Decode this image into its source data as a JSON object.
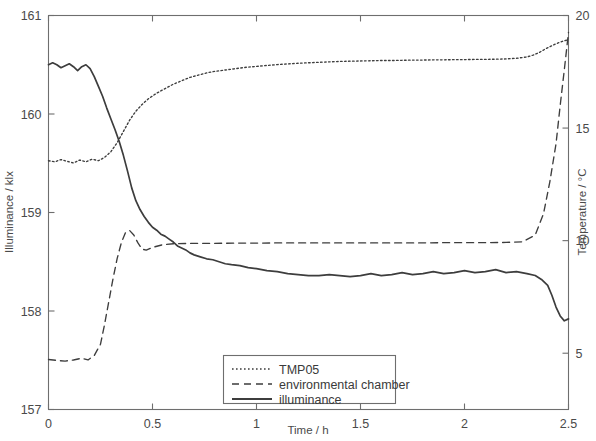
{
  "chart_data": {
    "type": "line",
    "title": "",
    "xlabel": "Time / h",
    "ylabel": "Illuminance / klx",
    "y2label": "Temperature / °C",
    "xlim": [
      0,
      2.5
    ],
    "ylim": [
      157,
      161
    ],
    "y2lim": [
      2.5,
      20
    ],
    "xticks": [
      0,
      0.5,
      1,
      1.5,
      2,
      2.5
    ],
    "xticklabels": [
      "0",
      "0.5",
      "1",
      "1.5",
      "2",
      "2.5"
    ],
    "yticks": [
      157,
      158,
      159,
      160,
      161
    ],
    "yticklabels": [
      "157",
      "158",
      "159",
      "160",
      "161"
    ],
    "y2ticks": [
      5,
      10,
      15,
      20
    ],
    "y2ticklabels": [
      "5",
      "10",
      "15",
      "20"
    ],
    "grid": false,
    "legend_position": "bottom-center",
    "legend_entries": [
      {
        "label": "TMP05",
        "style": "dotted",
        "axis": "right"
      },
      {
        "label": "environmental chamber",
        "style": "dashed",
        "axis": "right"
      },
      {
        "label": "illuminance",
        "style": "solid",
        "axis": "left"
      }
    ],
    "series": [
      {
        "name": "TMP05",
        "style": "dotted",
        "axis": "right",
        "unit": "°C",
        "x": [
          0.0,
          0.03,
          0.06,
          0.09,
          0.12,
          0.15,
          0.18,
          0.21,
          0.24,
          0.27,
          0.3,
          0.33,
          0.36,
          0.39,
          0.42,
          0.45,
          0.48,
          0.52,
          0.56,
          0.6,
          0.64,
          0.68,
          0.72,
          0.76,
          0.8,
          0.85,
          0.9,
          0.95,
          1.0,
          1.05,
          1.1,
          1.15,
          1.2,
          1.25,
          1.3,
          1.35,
          1.4,
          1.45,
          1.5,
          1.55,
          1.6,
          1.65,
          1.7,
          1.75,
          1.8,
          1.85,
          1.9,
          1.95,
          2.0,
          2.05,
          2.1,
          2.15,
          2.2,
          2.25,
          2.3,
          2.33,
          2.36,
          2.39,
          2.42,
          2.45,
          2.47,
          2.49,
          2.5
        ],
        "y": [
          13.55,
          13.5,
          13.6,
          13.52,
          13.45,
          13.58,
          13.5,
          13.62,
          13.55,
          13.7,
          13.95,
          14.35,
          14.85,
          15.35,
          15.75,
          16.05,
          16.3,
          16.55,
          16.75,
          16.95,
          17.1,
          17.25,
          17.35,
          17.45,
          17.52,
          17.58,
          17.64,
          17.7,
          17.74,
          17.78,
          17.82,
          17.85,
          17.88,
          17.9,
          17.92,
          17.94,
          17.96,
          17.97,
          17.98,
          17.99,
          18.0,
          18.0,
          18.01,
          18.02,
          18.02,
          18.03,
          18.03,
          18.04,
          18.04,
          18.05,
          18.05,
          18.06,
          18.07,
          18.1,
          18.16,
          18.24,
          18.36,
          18.52,
          18.66,
          18.78,
          18.85,
          18.9,
          18.93
        ]
      },
      {
        "name": "environmental chamber",
        "style": "dashed",
        "axis": "right",
        "unit": "°C",
        "x": [
          0.0,
          0.04,
          0.08,
          0.12,
          0.16,
          0.19,
          0.22,
          0.25,
          0.27,
          0.29,
          0.31,
          0.33,
          0.35,
          0.37,
          0.39,
          0.41,
          0.43,
          0.45,
          0.47,
          0.5,
          0.55,
          0.6,
          0.7,
          0.8,
          0.9,
          1.0,
          1.1,
          1.2,
          1.3,
          1.4,
          1.5,
          1.6,
          1.7,
          1.8,
          1.9,
          2.0,
          2.1,
          2.2,
          2.28,
          2.34,
          2.38,
          2.41,
          2.44,
          2.46,
          2.48,
          2.5
        ],
        "y": [
          4.72,
          4.68,
          4.65,
          4.7,
          4.78,
          4.7,
          4.9,
          5.4,
          6.3,
          7.3,
          8.3,
          9.2,
          9.9,
          10.35,
          10.45,
          10.25,
          9.9,
          9.62,
          9.58,
          9.7,
          9.82,
          9.86,
          9.88,
          9.88,
          9.89,
          9.89,
          9.9,
          9.9,
          9.9,
          9.9,
          9.9,
          9.9,
          9.9,
          9.9,
          9.91,
          9.91,
          9.91,
          9.92,
          9.95,
          10.25,
          11.2,
          12.6,
          14.3,
          16.0,
          17.6,
          19.25
        ]
      },
      {
        "name": "illuminance",
        "style": "solid",
        "axis": "left",
        "unit": "klx",
        "x": [
          0.0,
          0.02,
          0.04,
          0.06,
          0.08,
          0.1,
          0.12,
          0.14,
          0.16,
          0.18,
          0.2,
          0.22,
          0.24,
          0.26,
          0.28,
          0.3,
          0.32,
          0.34,
          0.36,
          0.38,
          0.4,
          0.42,
          0.44,
          0.46,
          0.48,
          0.5,
          0.52,
          0.54,
          0.56,
          0.58,
          0.6,
          0.62,
          0.64,
          0.66,
          0.68,
          0.7,
          0.73,
          0.76,
          0.79,
          0.82,
          0.85,
          0.88,
          0.92,
          0.96,
          1.0,
          1.05,
          1.1,
          1.15,
          1.2,
          1.25,
          1.3,
          1.35,
          1.4,
          1.45,
          1.5,
          1.55,
          1.6,
          1.65,
          1.7,
          1.75,
          1.8,
          1.85,
          1.9,
          1.95,
          2.0,
          2.05,
          2.1,
          2.15,
          2.2,
          2.25,
          2.3,
          2.34,
          2.37,
          2.4,
          2.42,
          2.44,
          2.46,
          2.48,
          2.5
        ],
        "y": [
          160.5,
          160.52,
          160.5,
          160.47,
          160.49,
          160.51,
          160.48,
          160.44,
          160.48,
          160.5,
          160.46,
          160.38,
          160.28,
          160.18,
          160.06,
          159.95,
          159.84,
          159.72,
          159.58,
          159.42,
          159.25,
          159.12,
          159.03,
          158.96,
          158.9,
          158.85,
          158.82,
          158.78,
          158.76,
          158.73,
          158.7,
          158.66,
          158.64,
          158.62,
          158.59,
          158.57,
          158.55,
          158.53,
          158.52,
          158.5,
          158.48,
          158.47,
          158.46,
          158.44,
          158.43,
          158.41,
          158.4,
          158.38,
          158.37,
          158.36,
          158.36,
          158.37,
          158.36,
          158.35,
          158.36,
          158.38,
          158.36,
          158.37,
          158.39,
          158.37,
          158.38,
          158.4,
          158.38,
          158.39,
          158.41,
          158.39,
          158.4,
          158.42,
          158.39,
          158.4,
          158.38,
          158.36,
          158.32,
          158.26,
          158.16,
          158.04,
          157.95,
          157.9,
          157.92
        ]
      }
    ]
  }
}
